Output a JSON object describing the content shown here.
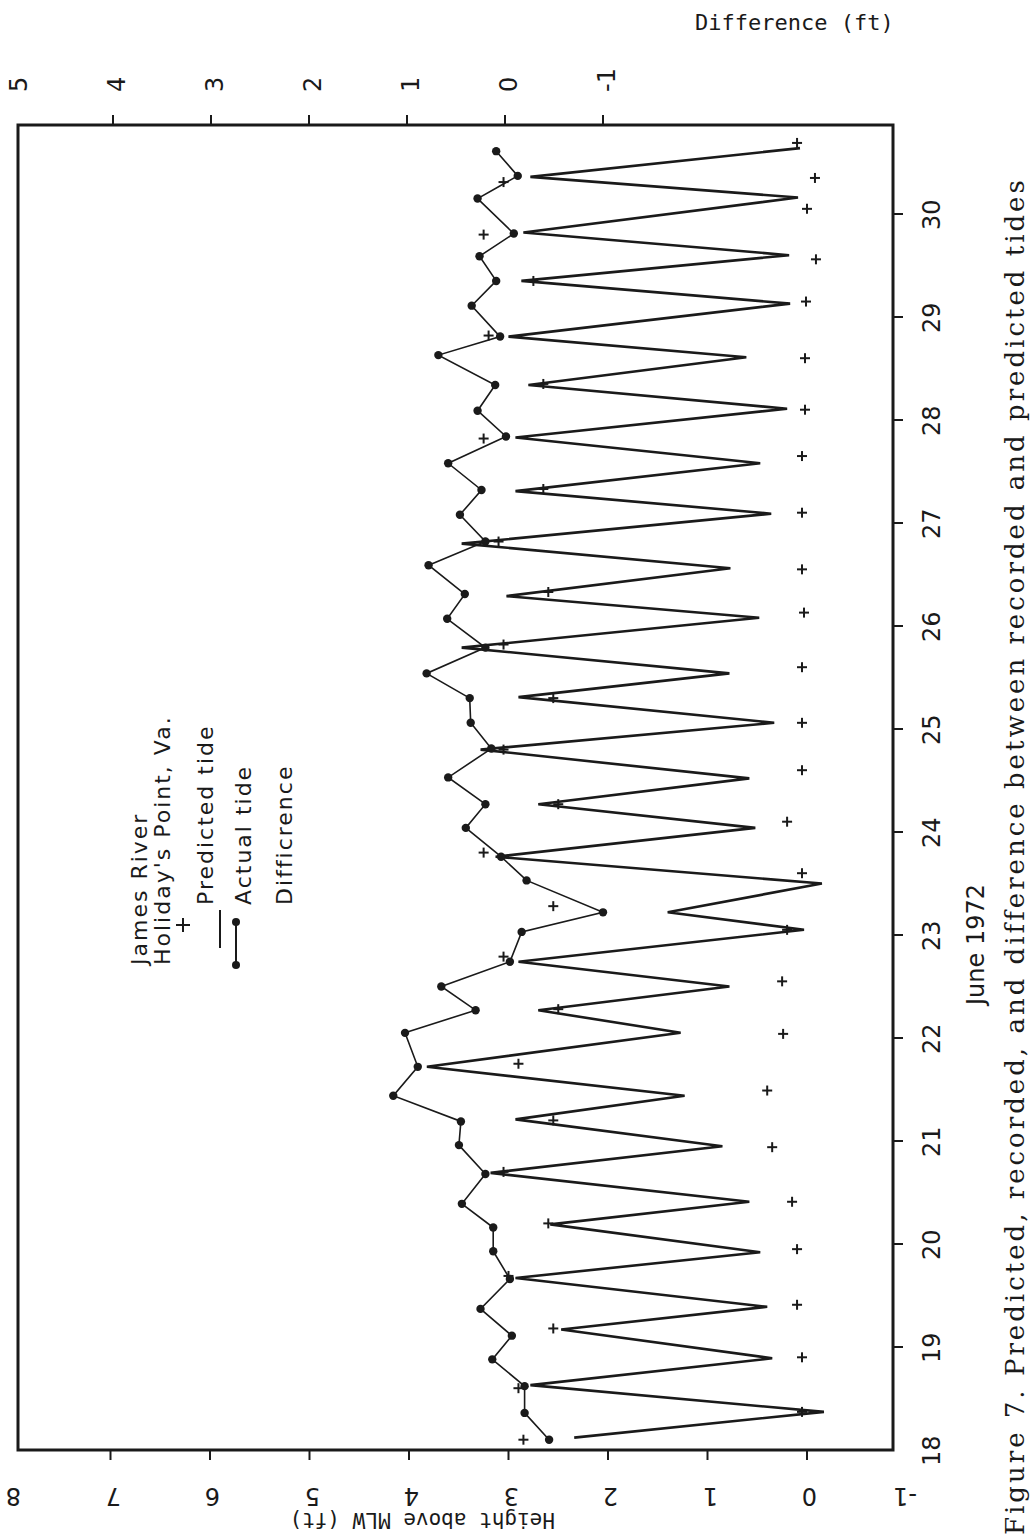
{
  "figure": {
    "caption": "Figure 7. Predicted, recorded, and difference between recorded and predicted tides",
    "orientation": "rotated 90 degrees counter-clockwise on page"
  },
  "chart_data": {
    "type": "line",
    "xlabel": "June 1972",
    "ylabel": "Height above MLW (ft)",
    "y2label": "Difference (ft)",
    "xlim": [
      18,
      30.8
    ],
    "ylim": [
      -1,
      8
    ],
    "y2lim": [
      -1,
      5
    ],
    "x_ticks": [
      "18",
      "19",
      "20",
      "21",
      "22",
      "23",
      "24",
      "25",
      "26",
      "27",
      "28",
      "29",
      "30"
    ],
    "y_ticks": [
      "-1",
      "0",
      "1",
      "2",
      "3",
      "4",
      "5",
      "6",
      "7",
      "8"
    ],
    "y2_ticks": [
      "-1",
      "0",
      "1",
      "2",
      "3",
      "4",
      "5"
    ],
    "grid": false,
    "legend": {
      "position": "upper left (inside plot)",
      "title_lines": [
        "James River",
        "Holiday's Point, Va."
      ],
      "entries": [
        {
          "marker": "+",
          "label": "Predicted tide"
        },
        {
          "marker": "line",
          "label": "Actual tide"
        },
        {
          "marker": "line-dot",
          "label": "Difference"
        }
      ]
    },
    "series": [
      {
        "name": "Actual tide",
        "style": "line",
        "axis": "left",
        "points": [
          [
            18.12,
            2.34
          ],
          [
            18.37,
            -0.17
          ],
          [
            18.63,
            2.78
          ],
          [
            18.89,
            0.35
          ],
          [
            19.17,
            2.47
          ],
          [
            19.39,
            0.4
          ],
          [
            19.67,
            2.93
          ],
          [
            19.92,
            0.47
          ],
          [
            20.19,
            2.58
          ],
          [
            20.41,
            0.58
          ],
          [
            20.69,
            3.18
          ],
          [
            20.95,
            0.85
          ],
          [
            21.21,
            2.93
          ],
          [
            21.44,
            1.23
          ],
          [
            21.72,
            3.82
          ],
          [
            22.05,
            1.27
          ],
          [
            22.27,
            2.7
          ],
          [
            22.5,
            0.78
          ],
          [
            22.74,
            2.9
          ],
          [
            23.05,
            0.03
          ],
          [
            23.22,
            1.4
          ],
          [
            23.5,
            -0.15
          ],
          [
            23.76,
            3.13
          ],
          [
            24.04,
            0.52
          ],
          [
            24.27,
            2.7
          ],
          [
            24.52,
            0.58
          ],
          [
            24.8,
            3.28
          ],
          [
            25.06,
            0.33
          ],
          [
            25.31,
            2.9
          ],
          [
            25.54,
            0.78
          ],
          [
            25.79,
            3.47
          ],
          [
            26.08,
            0.48
          ],
          [
            26.29,
            3.02
          ],
          [
            26.56,
            0.77
          ],
          [
            26.8,
            3.47
          ],
          [
            27.09,
            0.36
          ],
          [
            27.31,
            2.93
          ],
          [
            27.58,
            0.47
          ],
          [
            27.83,
            2.93
          ],
          [
            28.11,
            0.2
          ],
          [
            28.34,
            2.8
          ],
          [
            28.61,
            0.61
          ],
          [
            28.81,
            3.0
          ],
          [
            29.13,
            0.17
          ],
          [
            29.35,
            2.87
          ],
          [
            29.6,
            0.18
          ],
          [
            29.82,
            2.85
          ],
          [
            30.16,
            0.09
          ],
          [
            30.36,
            2.78
          ],
          [
            30.64,
            0.07
          ]
        ]
      },
      {
        "name": "Predicted tide",
        "style": "plus",
        "axis": "left",
        "points": [
          [
            18.1,
            2.85
          ],
          [
            18.37,
            0.05
          ],
          [
            18.6,
            2.9
          ],
          [
            18.9,
            0.05
          ],
          [
            19.18,
            2.55
          ],
          [
            19.41,
            0.1
          ],
          [
            19.69,
            3.0
          ],
          [
            19.95,
            0.1
          ],
          [
            20.2,
            2.6
          ],
          [
            20.41,
            0.15
          ],
          [
            20.7,
            3.05
          ],
          [
            20.94,
            0.35
          ],
          [
            21.2,
            2.55
          ],
          [
            21.49,
            0.4
          ],
          [
            21.75,
            2.9
          ],
          [
            22.04,
            0.24
          ],
          [
            22.28,
            2.5
          ],
          [
            22.55,
            0.25
          ],
          [
            22.79,
            3.05
          ],
          [
            23.05,
            0.2
          ],
          [
            23.28,
            2.55
          ],
          [
            23.6,
            0.05
          ],
          [
            23.8,
            3.25
          ],
          [
            24.1,
            0.2
          ],
          [
            24.27,
            2.5
          ],
          [
            24.6,
            0.05
          ],
          [
            24.8,
            3.05
          ],
          [
            25.06,
            0.05
          ],
          [
            25.3,
            2.55
          ],
          [
            25.6,
            0.05
          ],
          [
            25.82,
            3.05
          ],
          [
            26.13,
            0.03
          ],
          [
            26.33,
            2.6
          ],
          [
            26.55,
            0.05
          ],
          [
            26.82,
            3.1
          ],
          [
            27.1,
            0.05
          ],
          [
            27.33,
            2.65
          ],
          [
            27.65,
            0.05
          ],
          [
            27.82,
            3.25
          ],
          [
            28.1,
            0.02
          ],
          [
            28.35,
            2.65
          ],
          [
            28.6,
            0.02
          ],
          [
            28.82,
            3.2
          ],
          [
            29.15,
            0.01
          ],
          [
            29.35,
            2.75
          ],
          [
            29.56,
            -0.09
          ],
          [
            29.8,
            3.25
          ],
          [
            30.05,
            0.0
          ],
          [
            30.31,
            3.05
          ],
          [
            30.35,
            -0.08
          ],
          [
            30.69,
            0.1
          ]
        ]
      },
      {
        "name": "Difference",
        "style": "line-dot",
        "axis": "right",
        "points": [
          [
            18.1,
            -0.45
          ],
          [
            18.36,
            -0.2
          ],
          [
            18.62,
            -0.2
          ],
          [
            18.88,
            0.13
          ],
          [
            19.11,
            -0.07
          ],
          [
            19.37,
            0.25
          ],
          [
            19.66,
            -0.05
          ],
          [
            19.93,
            0.12
          ],
          [
            20.16,
            0.12
          ],
          [
            20.39,
            0.44
          ],
          [
            20.68,
            0.2
          ],
          [
            20.96,
            0.47
          ],
          [
            21.19,
            0.45
          ],
          [
            21.44,
            1.14
          ],
          [
            21.72,
            0.89
          ],
          [
            22.05,
            1.02
          ],
          [
            22.27,
            0.3
          ],
          [
            22.5,
            0.65
          ],
          [
            22.74,
            -0.05
          ],
          [
            23.03,
            -0.17
          ],
          [
            23.22,
            -1.0
          ],
          [
            23.53,
            -0.22
          ],
          [
            23.76,
            0.04
          ],
          [
            24.04,
            0.4
          ],
          [
            24.27,
            0.2
          ],
          [
            24.53,
            0.58
          ],
          [
            24.81,
            0.14
          ],
          [
            25.06,
            0.35
          ],
          [
            25.3,
            0.36
          ],
          [
            25.54,
            0.8
          ],
          [
            25.79,
            0.2
          ],
          [
            26.07,
            0.59
          ],
          [
            26.31,
            0.41
          ],
          [
            26.59,
            0.78
          ],
          [
            26.82,
            0.2
          ],
          [
            27.08,
            0.46
          ],
          [
            27.32,
            0.24
          ],
          [
            27.58,
            0.58
          ],
          [
            27.84,
            -0.01
          ],
          [
            28.09,
            0.28
          ],
          [
            28.34,
            0.1
          ],
          [
            28.63,
            0.68
          ],
          [
            28.81,
            0.05
          ],
          [
            29.11,
            0.34
          ],
          [
            29.35,
            0.09
          ],
          [
            29.59,
            0.26
          ],
          [
            29.81,
            -0.09
          ],
          [
            30.15,
            0.28
          ],
          [
            30.37,
            -0.13
          ],
          [
            30.61,
            0.09
          ]
        ]
      }
    ]
  },
  "axes": {
    "left_title": "Height above MLW (ft)",
    "top_title": "Difference (ft)",
    "time_title": "June 1972"
  },
  "legend": {
    "line1": "James River",
    "line2": "Holiday's Point, Va.",
    "predicted": "Predicted tide",
    "actual": "Actual tide",
    "difference": "Difficrence"
  }
}
